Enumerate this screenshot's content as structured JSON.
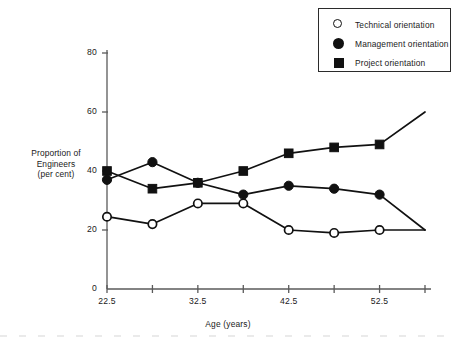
{
  "chart_data": {
    "type": "line",
    "title": "",
    "xlabel": "Age (years)",
    "ylabel": "Proportion of\nEngineers\n(per cent)",
    "ylabel_lines": [
      "Proportion of",
      "Engineers",
      "(per cent)"
    ],
    "x": [
      22.5,
      27.5,
      32.5,
      37.5,
      42.5,
      47.5,
      52.5,
      57.5
    ],
    "xlim": [
      22.5,
      57.5
    ],
    "ylim": [
      0,
      80
    ],
    "xticks": [
      22.5,
      27.5,
      32.5,
      37.5,
      42.5,
      47.5,
      52.5,
      57.5
    ],
    "xtick_labels": [
      "22.5",
      "",
      "32.5",
      "",
      "42.5",
      "",
      "52.5",
      ""
    ],
    "yticks": [
      0,
      20,
      40,
      60,
      80
    ],
    "ytick_labels": [
      "0",
      "20",
      "40",
      "60",
      "80"
    ],
    "grid": false,
    "legend_position": "top-right",
    "series": [
      {
        "name": "Technical orientation",
        "marker": "open-circle",
        "values": [
          24.5,
          22,
          29,
          29,
          20,
          19,
          20,
          20
        ],
        "marker_visible": [
          true,
          true,
          true,
          true,
          true,
          true,
          true,
          false
        ]
      },
      {
        "name": "Management orientation",
        "marker": "filled-circle",
        "values": [
          37,
          43,
          36,
          32,
          35,
          34,
          32,
          20
        ],
        "marker_visible": [
          true,
          true,
          true,
          true,
          true,
          true,
          true,
          false
        ]
      },
      {
        "name": "Project orientation",
        "marker": "filled-square",
        "values": [
          40,
          34,
          36,
          40,
          46,
          48,
          49,
          60
        ],
        "marker_visible": [
          true,
          true,
          true,
          true,
          true,
          true,
          true,
          false
        ]
      }
    ]
  },
  "legend": {
    "items": [
      {
        "label": "Technical orientation",
        "marker": "open-circle"
      },
      {
        "label": "Management orientation",
        "marker": "filled-circle"
      },
      {
        "label": "Project orientation",
        "marker": "filled-square"
      }
    ]
  },
  "axes": {
    "y_label_line1": "Proportion of",
    "y_label_line2": "Engineers",
    "y_label_line3": "(per cent)",
    "x_axis_title": "Age (years)",
    "y_ticks": [
      "80",
      "60",
      "40",
      "20",
      "0"
    ],
    "x_ticks": [
      "22.5",
      "32.5",
      "42.5",
      "52.5"
    ]
  },
  "colors": {
    "ink": "#111111",
    "axis": "#5a5a5a",
    "background": "#ffffff"
  }
}
